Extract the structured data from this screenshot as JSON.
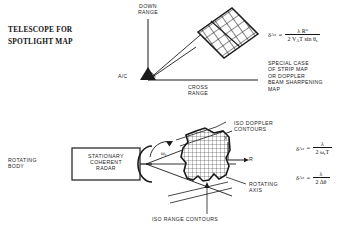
{
  "figure": {
    "domain": "radar-imaging-diagram",
    "title_block": "TELESCOPE\nFOR\nSPOTLIGHT\nMAP"
  },
  "top_panel": {
    "down_range_label": "DOWN\nRANGE",
    "cross_range_label": "CROSS\nRANGE",
    "aircraft_label": "A/C",
    "map_patch_name": "spotlight-map-patch",
    "note_block": "SPECIAL CASE\nOF STRIP MAP\nOR DOPPLER\nBEAM SHARPENING\nMAP",
    "formula": {
      "lhs": "δ",
      "lhs_sub": "A",
      "lhs_sub2": "z",
      "equals": "=",
      "numerator": "λ R",
      "numerator_sup": "o",
      "denominator": "2 V",
      "denominator_sub": "A",
      "denominator_rest": "T sin θ",
      "denominator_sub2": "s",
      "plain": "δAz = λRo / (2 VA T sin θs)"
    }
  },
  "bottom_panel": {
    "rotating_body_label": "ROTATING\nBODY",
    "radar_box_label": "STATIONARY\nCOHERENT\nRADAR",
    "iso_doppler_label": "ISO  DOPPLER\nCONTOURS",
    "iso_range_label": "ISO  RANGE CONTOURS",
    "rotating_axis_label": "ROTATING\nAXIS",
    "omega_label": "ω",
    "omega_sub": "r",
    "axis_x_label": "X",
    "axis_r_label": "R",
    "formula_1": {
      "lhs": "δ",
      "lhs_sub": "A",
      "lhs_sub2": "z",
      "equals": "=",
      "numerator": "λ",
      "denominator": "2 ω",
      "denominator_sub": "r",
      "denominator_rest": "T",
      "plain": "δAz = λ / (2 ωr T)"
    },
    "formula_2": {
      "lhs": "δ",
      "lhs_sub": "A",
      "lhs_sub2": "z",
      "equals": "=",
      "numerator": "λ",
      "denominator": "2 Δθ",
      "plain": "δAz = λ / (2 Δθ)"
    }
  },
  "colors": {
    "ink": "#1a1a1a",
    "paper": "#ffffff",
    "grid": "#2a2a2a"
  }
}
